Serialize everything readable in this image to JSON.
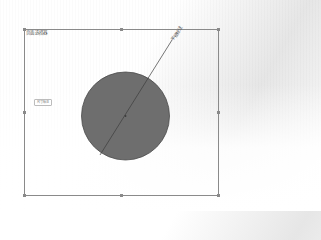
{
  "canvas": {
    "background_color": "#ffffff",
    "frame": {
      "title": "页面选择器",
      "border_color": "#8a8a8a",
      "x": 24,
      "y": 29,
      "width": 195,
      "height": 167
    }
  },
  "side_label": {
    "text": "尺寸标注"
  },
  "circle": {
    "cx": 125.5,
    "cy": 116,
    "r": 44,
    "fill": "#6e6e6e",
    "stroke": "#4a4a4a"
  },
  "diameter_line": {
    "x1": 100,
    "y1": 155,
    "x2": 172,
    "y2": 40,
    "color": "#3c3c3c",
    "label": "半径标注"
  }
}
